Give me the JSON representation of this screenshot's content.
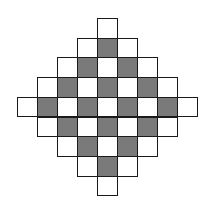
{
  "diagram": {
    "type": "diamond-checkerboard",
    "rows": 9,
    "cols": 9,
    "center": [
      4,
      4
    ],
    "radius": 4,
    "origin": {
      "x": 17,
      "y": 18
    },
    "cell_w": 20,
    "cell_h": 19.7,
    "colors": {
      "shaded": "#7a7a7a",
      "unshaded": "#ffffff",
      "border": "#1a1a1a"
    },
    "row_cells": [
      {
        "row": 0,
        "start_col": 4,
        "pattern": "W"
      },
      {
        "row": 1,
        "start_col": 3,
        "pattern": "WGW"
      },
      {
        "row": 2,
        "start_col": 2,
        "pattern": "WGWGW"
      },
      {
        "row": 3,
        "start_col": 1,
        "pattern": "WGWGWGW"
      },
      {
        "row": 4,
        "start_col": 0,
        "pattern": "WGWGWGWGW"
      },
      {
        "row": 5,
        "start_col": 1,
        "pattern": "WGWGWGW"
      },
      {
        "row": 6,
        "start_col": 2,
        "pattern": "WGWGW"
      },
      {
        "row": 7,
        "start_col": 3,
        "pattern": "WGW"
      },
      {
        "row": 8,
        "start_col": 4,
        "pattern": "W"
      }
    ],
    "counts": {
      "total_cells": 41,
      "shaded_cells": 16,
      "unshaded_cells": 25
    }
  }
}
